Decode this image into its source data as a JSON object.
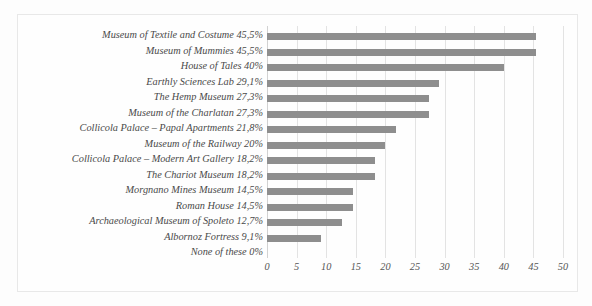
{
  "chart_data": {
    "type": "bar",
    "orientation": "horizontal",
    "title": "",
    "subtitle": "",
    "xlabel": "",
    "ylabel": "",
    "xlim": [
      0,
      50
    ],
    "xticks": [
      0,
      5,
      10,
      15,
      20,
      25,
      30,
      35,
      40,
      45,
      50
    ],
    "grid": true,
    "legend": false,
    "bar_color": "#8e8e8e",
    "categories": [
      "Museum of Textile and Costume 45,5%",
      "Museum of Mummies 45,5%",
      "House of Tales 40%",
      "Earthly Sciences Lab 29,1%",
      "The Hemp Museum 27,3%",
      "Museum of the Charlatan 27,3%",
      "Collicola Palace – Papal Apartments 21,8%",
      "Museum of the Railway 20%",
      "Collicola Palace – Modern Art Gallery 18,2%",
      "The Chariot Museum 18,2%",
      "Morgnano Mines Museum 14,5%",
      "Roman House 14,5%",
      "Archaeological Museum of Spoleto 12,7%",
      "Albornoz Fortress 9,1%",
      "None of these 0%"
    ],
    "values": [
      45.5,
      45.5,
      40,
      29.1,
      27.3,
      27.3,
      21.8,
      20,
      18.2,
      18.2,
      14.5,
      14.5,
      12.7,
      9.1,
      0
    ]
  }
}
